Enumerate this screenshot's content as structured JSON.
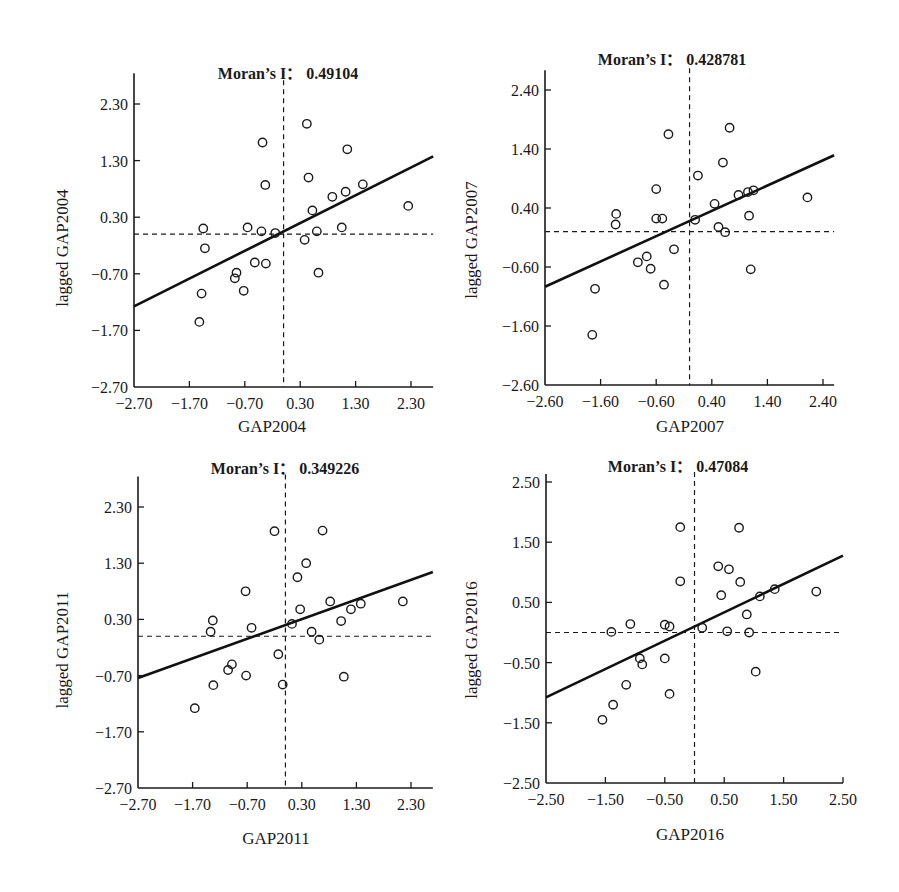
{
  "chart_data": [
    {
      "type": "scatter",
      "title": "Moran's I: 0.49104",
      "title_prefix": "Moran’s I：",
      "moran_i": "0.49104",
      "xlabel": "GAP2004",
      "ylabel": "lagged GAP2004",
      "xlim": [
        -2.7,
        2.7
      ],
      "ylim": [
        -2.7,
        2.7
      ],
      "xticks": [
        "-2.70",
        "-1.70",
        "-0.70",
        "0.30",
        "1.30",
        "2.30"
      ],
      "yticks": [
        "-2.70",
        "-1.70",
        "-0.70",
        "0.30",
        "1.30",
        "2.30"
      ],
      "grid": false,
      "mean_lines": {
        "x": 0.0,
        "y": 0.0
      },
      "regression": {
        "slope": 0.49104,
        "intercept": 0.05
      },
      "points": [
        [
          -1.45,
          0.1
        ],
        [
          -1.42,
          -0.25
        ],
        [
          -1.48,
          -1.05
        ],
        [
          -1.52,
          -1.55
        ],
        [
          -0.88,
          -0.78
        ],
        [
          -0.85,
          -0.68
        ],
        [
          -0.72,
          -1.0
        ],
        [
          -0.65,
          0.12
        ],
        [
          -0.52,
          -0.5
        ],
        [
          -0.4,
          0.05
        ],
        [
          -0.32,
          -0.52
        ],
        [
          -0.38,
          1.62
        ],
        [
          -0.33,
          0.87
        ],
        [
          -0.15,
          0.02
        ],
        [
          0.42,
          1.95
        ],
        [
          0.45,
          1.0
        ],
        [
          0.52,
          0.42
        ],
        [
          0.6,
          0.05
        ],
        [
          0.63,
          -0.68
        ],
        [
          0.38,
          -0.1
        ],
        [
          0.88,
          0.66
        ],
        [
          1.12,
          0.75
        ],
        [
          1.05,
          0.12
        ],
        [
          1.15,
          1.5
        ],
        [
          1.43,
          0.88
        ],
        [
          2.25,
          0.5
        ]
      ]
    },
    {
      "type": "scatter",
      "title": "Moran's I: 0.428781",
      "title_prefix": "Moran’s I：",
      "moran_i": "0.428781",
      "xlabel": "GAP2007",
      "ylabel": "lagged GAP2007",
      "xlim": [
        -2.6,
        2.6
      ],
      "ylim": [
        -2.6,
        2.6
      ],
      "xticks": [
        "-2.60",
        "-1.60",
        "-0.60",
        "0.40",
        "1.40",
        "2.40"
      ],
      "yticks": [
        "-2.60",
        "-1.60",
        "-0.60",
        "0.40",
        "1.40",
        "2.40"
      ],
      "grid": false,
      "mean_lines": {
        "x": 0.0,
        "y": 0.0
      },
      "regression": {
        "slope": 0.428781,
        "intercept": 0.18
      },
      "points": [
        [
          -1.75,
          -1.75
        ],
        [
          -1.7,
          -0.97
        ],
        [
          -1.32,
          0.3
        ],
        [
          -1.33,
          0.12
        ],
        [
          -0.93,
          -0.52
        ],
        [
          -0.77,
          -0.42
        ],
        [
          -0.7,
          -0.63
        ],
        [
          -0.6,
          0.72
        ],
        [
          -0.6,
          0.22
        ],
        [
          -0.49,
          0.22
        ],
        [
          -0.46,
          -0.9
        ],
        [
          -0.38,
          1.65
        ],
        [
          -0.28,
          -0.3
        ],
        [
          0.1,
          0.2
        ],
        [
          0.15,
          0.95
        ],
        [
          0.45,
          0.47
        ],
        [
          0.52,
          0.08
        ],
        [
          0.64,
          -0.01
        ],
        [
          0.6,
          1.17
        ],
        [
          0.72,
          1.76
        ],
        [
          0.88,
          0.62
        ],
        [
          1.05,
          0.67
        ],
        [
          1.15,
          0.7
        ],
        [
          1.07,
          0.27
        ],
        [
          1.1,
          -0.64
        ],
        [
          2.12,
          0.58
        ]
      ]
    },
    {
      "type": "scatter",
      "title": "Moran's I: 0.349226",
      "title_prefix": "Moran’s I：",
      "moran_i": "0.349226",
      "xlabel": "GAP2011",
      "ylabel": "lagged GAP2011",
      "xlim": [
        -2.7,
        2.7
      ],
      "ylim": [
        -2.7,
        2.7
      ],
      "xticks": [
        "-2.70",
        "-1.70",
        "-0.70",
        "0.30",
        "1.30",
        "2.30"
      ],
      "yticks": [
        "-2.70",
        "-1.70",
        "-0.70",
        "0.30",
        "1.30",
        "2.30"
      ],
      "grid": false,
      "mean_lines": {
        "x": 0.0,
        "y": 0.0
      },
      "regression": {
        "slope": 0.349226,
        "intercept": 0.2
      },
      "points": [
        [
          -1.66,
          -1.28
        ],
        [
          -1.37,
          0.08
        ],
        [
          -1.33,
          0.28
        ],
        [
          -1.32,
          -0.87
        ],
        [
          -1.05,
          -0.6
        ],
        [
          -0.98,
          -0.5
        ],
        [
          -0.72,
          -0.7
        ],
        [
          -0.73,
          0.8
        ],
        [
          -0.62,
          0.15
        ],
        [
          -0.2,
          1.87
        ],
        [
          -0.13,
          -0.32
        ],
        [
          -0.05,
          -0.86
        ],
        [
          0.12,
          0.22
        ],
        [
          0.22,
          1.05
        ],
        [
          0.27,
          0.48
        ],
        [
          0.38,
          1.3
        ],
        [
          0.48,
          0.08
        ],
        [
          0.62,
          -0.06
        ],
        [
          0.82,
          0.62
        ],
        [
          0.68,
          1.88
        ],
        [
          1.02,
          0.27
        ],
        [
          1.07,
          -0.72
        ],
        [
          1.2,
          0.48
        ],
        [
          1.38,
          0.58
        ],
        [
          2.15,
          0.62
        ]
      ]
    },
    {
      "type": "scatter",
      "title": "Moran's I: 0.47084",
      "title_prefix": "Moran’s I：",
      "moran_i": "0.47084",
      "xlabel": "GAP2016",
      "ylabel": "lagged GAP2016",
      "xlim": [
        -2.5,
        2.5
      ],
      "ylim": [
        -2.5,
        2.5
      ],
      "xticks": [
        "-2.50",
        "-1.50",
        "-0.50",
        "0.50",
        "1.50",
        "2.50"
      ],
      "yticks": [
        "-2.50",
        "-1.50",
        "-0.50",
        "0.50",
        "1.50",
        "2.50"
      ],
      "grid": false,
      "mean_lines": {
        "x": 0.0,
        "y": 0.0
      },
      "regression": {
        "slope": 0.47084,
        "intercept": 0.1
      },
      "points": [
        [
          -1.55,
          -1.45
        ],
        [
          -1.37,
          -1.2
        ],
        [
          -1.4,
          0.01
        ],
        [
          -1.08,
          0.14
        ],
        [
          -1.15,
          -0.87
        ],
        [
          -0.92,
          -0.43
        ],
        [
          -0.88,
          -0.53
        ],
        [
          -0.5,
          -0.43
        ],
        [
          -0.5,
          0.13
        ],
        [
          -0.42,
          0.1
        ],
        [
          -0.42,
          -1.02
        ],
        [
          -0.24,
          1.75
        ],
        [
          -0.24,
          0.85
        ],
        [
          0.13,
          0.08
        ],
        [
          0.45,
          0.62
        ],
        [
          0.4,
          1.1
        ],
        [
          0.55,
          0.02
        ],
        [
          0.58,
          1.05
        ],
        [
          0.77,
          0.84
        ],
        [
          0.75,
          1.74
        ],
        [
          0.88,
          0.3
        ],
        [
          0.92,
          0.0
        ],
        [
          1.03,
          -0.65
        ],
        [
          1.1,
          0.6
        ],
        [
          1.35,
          0.72
        ],
        [
          2.05,
          0.68
        ]
      ]
    }
  ]
}
